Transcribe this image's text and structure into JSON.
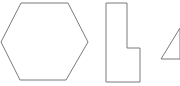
{
  "canvas": {
    "width": 180,
    "height": 86,
    "background_color": "#ffffff",
    "stroke_color": "#7b7b7b",
    "stroke_width": 1,
    "fill": "none"
  },
  "figure": {
    "type": "line-drawing",
    "shape_count": 3
  },
  "shapes": [
    {
      "name": "hexagon",
      "label": "hexagon",
      "sides": 6,
      "clipped": "left",
      "points": "21,3 68,3 88,42 66,80 20,80 1,42"
    },
    {
      "name": "l-shape",
      "label": "L-shape",
      "sides": 6,
      "clipped": "none",
      "points": "106,3 127,3 127,48 140,48 140,82 106,82"
    },
    {
      "name": "triangle",
      "label": "triangle",
      "sides": 3,
      "clipped": "right",
      "points": "161,59 180,28 180,59"
    }
  ]
}
